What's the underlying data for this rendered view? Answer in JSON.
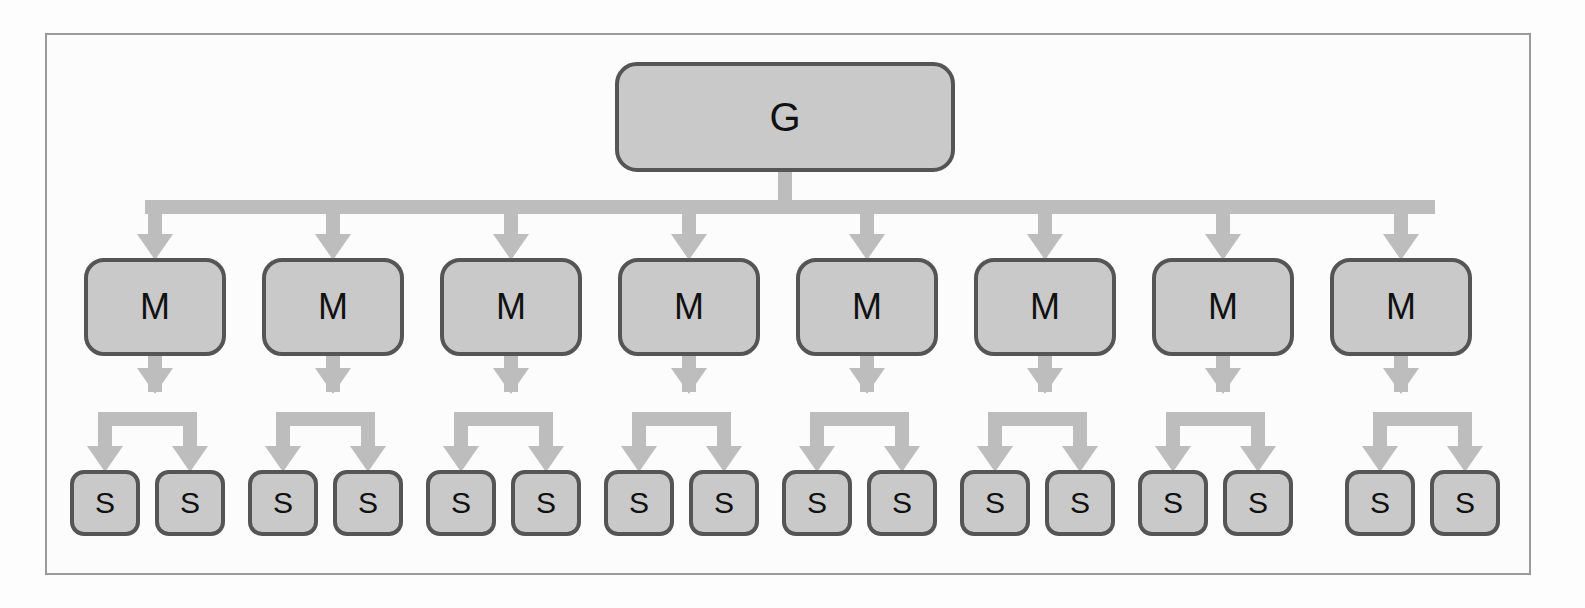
{
  "figure": {
    "type": "hierarchy-tree-diagram",
    "levels": 3,
    "colors": {
      "node_fill": "#c9c9c9",
      "node_border": "#555555",
      "connector": "#bdbdbd",
      "frame_border": "#9a9a9a",
      "background": "#fdfdfd",
      "label_text": "#111111"
    },
    "frame": {
      "x": 45,
      "y": 33,
      "width": 1486,
      "height": 542
    }
  },
  "nodes": {
    "root": {
      "label": "G",
      "role": "global-node",
      "x": 615,
      "y": 62,
      "width": 340,
      "height": 110
    },
    "middle_label": "M",
    "leaf_label": "S",
    "middle": [
      {
        "label": "M",
        "index": 1,
        "x": 84,
        "y": 258,
        "width": 142,
        "height": 98
      },
      {
        "label": "M",
        "index": 2,
        "x": 262,
        "y": 258,
        "width": 142,
        "height": 98
      },
      {
        "label": "M",
        "index": 3,
        "x": 440,
        "y": 258,
        "width": 142,
        "height": 98
      },
      {
        "label": "M",
        "index": 4,
        "x": 618,
        "y": 258,
        "width": 142,
        "height": 98
      },
      {
        "label": "M",
        "index": 5,
        "x": 796,
        "y": 258,
        "width": 142,
        "height": 98
      },
      {
        "label": "M",
        "index": 6,
        "x": 974,
        "y": 258,
        "width": 142,
        "height": 98
      },
      {
        "label": "M",
        "index": 7,
        "x": 1152,
        "y": 258,
        "width": 142,
        "height": 98
      },
      {
        "label": "M",
        "index": 8,
        "x": 1330,
        "y": 258,
        "width": 142,
        "height": 98
      }
    ],
    "leaves": [
      {
        "label": "S",
        "index": 1,
        "parent": 1,
        "x": 70,
        "y": 470,
        "width": 70,
        "height": 66
      },
      {
        "label": "S",
        "index": 2,
        "parent": 1,
        "x": 155,
        "y": 470,
        "width": 70,
        "height": 66
      },
      {
        "label": "S",
        "index": 3,
        "parent": 2,
        "x": 248,
        "y": 470,
        "width": 70,
        "height": 66
      },
      {
        "label": "S",
        "index": 4,
        "parent": 2,
        "x": 333,
        "y": 470,
        "width": 70,
        "height": 66
      },
      {
        "label": "S",
        "index": 5,
        "parent": 3,
        "x": 426,
        "y": 470,
        "width": 70,
        "height": 66
      },
      {
        "label": "S",
        "index": 6,
        "parent": 3,
        "x": 511,
        "y": 470,
        "width": 70,
        "height": 66
      },
      {
        "label": "S",
        "index": 7,
        "parent": 4,
        "x": 604,
        "y": 470,
        "width": 70,
        "height": 66
      },
      {
        "label": "S",
        "index": 8,
        "parent": 4,
        "x": 689,
        "y": 470,
        "width": 70,
        "height": 66
      },
      {
        "label": "S",
        "index": 9,
        "parent": 5,
        "x": 782,
        "y": 470,
        "width": 70,
        "height": 66
      },
      {
        "label": "S",
        "index": 10,
        "parent": 5,
        "x": 867,
        "y": 470,
        "width": 70,
        "height": 66
      },
      {
        "label": "S",
        "index": 11,
        "parent": 6,
        "x": 960,
        "y": 470,
        "width": 70,
        "height": 66
      },
      {
        "label": "S",
        "index": 12,
        "parent": 6,
        "x": 1045,
        "y": 470,
        "width": 70,
        "height": 66
      },
      {
        "label": "S",
        "index": 13,
        "parent": 7,
        "x": 1138,
        "y": 470,
        "width": 70,
        "height": 66
      },
      {
        "label": "S",
        "index": 14,
        "parent": 7,
        "x": 1223,
        "y": 470,
        "width": 70,
        "height": 66
      },
      {
        "label": "S",
        "index": 15,
        "parent": 8,
        "x": 1345,
        "y": 470,
        "width": 70,
        "height": 66
      },
      {
        "label": "S",
        "index": 16,
        "parent": 8,
        "x": 1430,
        "y": 470,
        "width": 70,
        "height": 66
      }
    ]
  },
  "connectors": {
    "root_stem": {
      "x": 785,
      "y_from": 172,
      "y_to": 200
    },
    "root_bus": {
      "x_from": 145,
      "x_to": 1435,
      "y": 200,
      "thickness": 14
    },
    "root_bus_arrow_targets": [
      155,
      333,
      511,
      689,
      867,
      1045,
      1223,
      1401
    ],
    "middle_bus_y": 412,
    "middle_bus_thickness": 14
  }
}
